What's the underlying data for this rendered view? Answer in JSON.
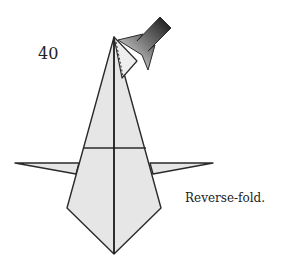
{
  "diagram": {
    "step_number": "40",
    "caption": "Reverse-fold.",
    "colors": {
      "paper": "#e6e6e6",
      "line": "#2a2a2a",
      "background": "#ffffff",
      "arrow_dark": "#111111",
      "arrow_light": "#ffffff"
    },
    "elements": [
      "origami-body",
      "left-wing",
      "right-wing",
      "center-crease",
      "horizontal-crease",
      "apex-flap-dashed-line",
      "reverse-fold-arrow"
    ]
  }
}
